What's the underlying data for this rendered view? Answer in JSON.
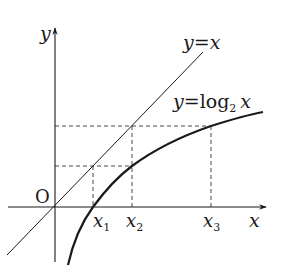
{
  "diagram": {
    "type": "function-graph",
    "axes": {
      "x_label": "x",
      "y_label": "y",
      "origin_label": "O"
    },
    "curves": [
      {
        "name": "identity-line",
        "label": "y=x",
        "label_lhs": "y",
        "label_eq": "=",
        "label_rhs": "x"
      },
      {
        "name": "log2-curve",
        "label": "y=log2 x",
        "label_lhs": "y",
        "label_eq": "=",
        "label_fn": "log",
        "label_base": "2",
        "label_arg": "x"
      }
    ],
    "x_marks": [
      {
        "label": "x",
        "subscript": "1"
      },
      {
        "label": "x",
        "subscript": "2"
      },
      {
        "label": "x",
        "subscript": "3"
      }
    ],
    "colors": {
      "stroke": "#1a1a1a",
      "dashed": "#333333",
      "background": "#ffffff"
    }
  }
}
